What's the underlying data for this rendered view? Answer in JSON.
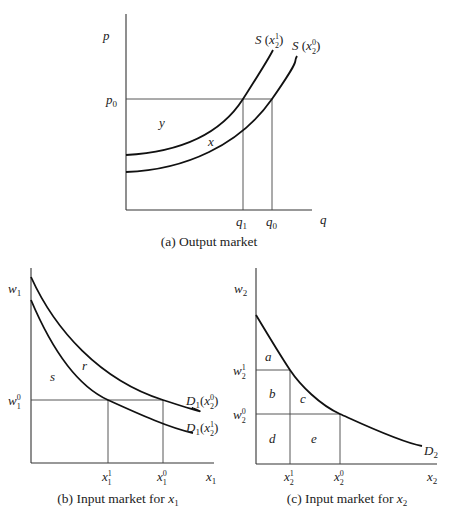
{
  "panels": {
    "a": {
      "caption": "(a) Output market",
      "y_axis_label": "p",
      "x_axis_label": "q",
      "price_level": "p",
      "price_level_sub": "0",
      "q_ticks": [
        {
          "base": "q",
          "sub": "1"
        },
        {
          "base": "q",
          "sub": "0"
        }
      ],
      "curves": [
        {
          "name": "S",
          "arg_base": "x",
          "arg_sup": "1",
          "arg_sub": "2"
        },
        {
          "name": "S",
          "arg_base": "x",
          "arg_sup": "0",
          "arg_sub": "2"
        }
      ],
      "regions": [
        "y",
        "x"
      ]
    },
    "b": {
      "caption_prefix": "(b) Input market for ",
      "caption_var": "x",
      "caption_sub": "1",
      "y_axis_label": "w",
      "y_axis_sub": "1",
      "x_axis_label": "x",
      "x_axis_sub": "1",
      "price_level": {
        "base": "w",
        "sup": "0",
        "sub": "1"
      },
      "x_ticks": [
        {
          "base": "x",
          "sup": "1",
          "sub": "1"
        },
        {
          "base": "x",
          "sup": "0",
          "sub": "1"
        }
      ],
      "curves": [
        {
          "name": "D",
          "name_sub": "1",
          "arg_base": "x",
          "arg_sup": "0",
          "arg_sub": "2"
        },
        {
          "name": "D",
          "name_sub": "1",
          "arg_base": "x",
          "arg_sup": "1",
          "arg_sub": "2"
        }
      ],
      "regions": [
        "s",
        "r"
      ]
    },
    "c": {
      "caption_prefix": "(c) Input market for ",
      "caption_var": "x",
      "caption_sub": "2",
      "y_axis_label": "w",
      "y_axis_sub": "2",
      "x_axis_label": "x",
      "x_axis_sub": "2",
      "price_levels": [
        {
          "base": "w",
          "sup": "1",
          "sub": "2"
        },
        {
          "base": "w",
          "sup": "0",
          "sub": "2"
        }
      ],
      "x_ticks": [
        {
          "base": "x",
          "sup": "1",
          "sub": "2"
        },
        {
          "base": "x",
          "sup": "0",
          "sub": "2"
        }
      ],
      "curve": {
        "name": "D",
        "name_sub": "2"
      },
      "regions": [
        "a",
        "b",
        "c",
        "d",
        "e"
      ]
    }
  },
  "colors": {
    "ink": "#222222",
    "background": "#ffffff"
  }
}
